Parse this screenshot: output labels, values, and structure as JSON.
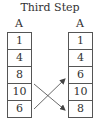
{
  "title": "Third Step",
  "left_array": {
    "label": "A",
    "cells": [
      "1",
      "4",
      "8",
      "10",
      "6"
    ]
  },
  "right_array": {
    "label": "A",
    "cells": [
      "1",
      "4",
      "6",
      "10",
      "8"
    ]
  },
  "swap": {
    "from_left_index": 2,
    "to_right_index": 4,
    "from_left_index_2": 4,
    "to_right_index_2": 2,
    "values": [
      "8",
      "6"
    ]
  },
  "colors": {
    "border": "#555555",
    "text": "#333333",
    "arrow": "#444444"
  }
}
